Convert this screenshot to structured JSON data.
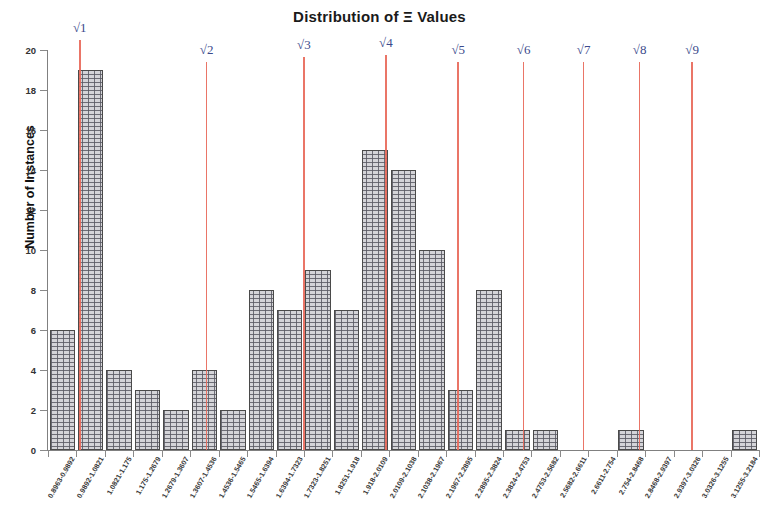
{
  "chart_data": {
    "type": "bar",
    "title": "Distribution of Ξ Values",
    "xlabel": "",
    "ylabel": "Number of Instances",
    "ylim": [
      0,
      20
    ],
    "ytick_values": [
      0,
      2,
      4,
      6,
      8,
      10,
      12,
      14,
      16,
      18,
      20
    ],
    "grid": false,
    "legend": null,
    "bar_color": "#d4d4d8",
    "bar_edge_color": "#4a4a4a",
    "reference_line_color": "#e8695a",
    "reference_label_color": "#3b4a8c",
    "bin_width": 0.0929,
    "x_range": [
      0.8963,
      3.2184
    ],
    "categories": [
      "0.8963-0.9892",
      "0.9892-1.0821",
      "1.0821-1.175",
      "1.175-1.2679",
      "1.2679-1.3607",
      "1.3607-1.4536",
      "1.4536-1.5465",
      "1.5465-1.6394",
      "1.6394-1.7323",
      "1.7323-1.8251",
      "1.8251-1.918",
      "1.918-2.0109",
      "2.0109-2.1038",
      "2.1038-2.1967",
      "2.1967-2.2895",
      "2.2895-2.3824",
      "2.3824-2.4753",
      "2.4753-2.5682",
      "2.5682-2.6611",
      "2.6611-2.754",
      "2.754-2.8468",
      "2.8468-2.9397",
      "2.9397-3.0326",
      "3.0326-3.1255",
      "3.1255-3.2184"
    ],
    "values": [
      6,
      19,
      4,
      3,
      2,
      4,
      2,
      8,
      7,
      9,
      7,
      15,
      14,
      10,
      3,
      8,
      1,
      1,
      0,
      0,
      1,
      0,
      0,
      0,
      1
    ],
    "annotations": [
      {
        "label": "√1",
        "value": 1.0
      },
      {
        "label": "√2",
        "value": 1.4142
      },
      {
        "label": "√3",
        "value": 1.7321
      },
      {
        "label": "√4",
        "value": 2.0
      },
      {
        "label": "√5",
        "value": 2.2361
      },
      {
        "label": "√6",
        "value": 2.4495
      },
      {
        "label": "√7",
        "value": 2.6458
      },
      {
        "label": "√8",
        "value": 2.8284
      },
      {
        "label": "√9",
        "value": 3.0
      }
    ]
  }
}
